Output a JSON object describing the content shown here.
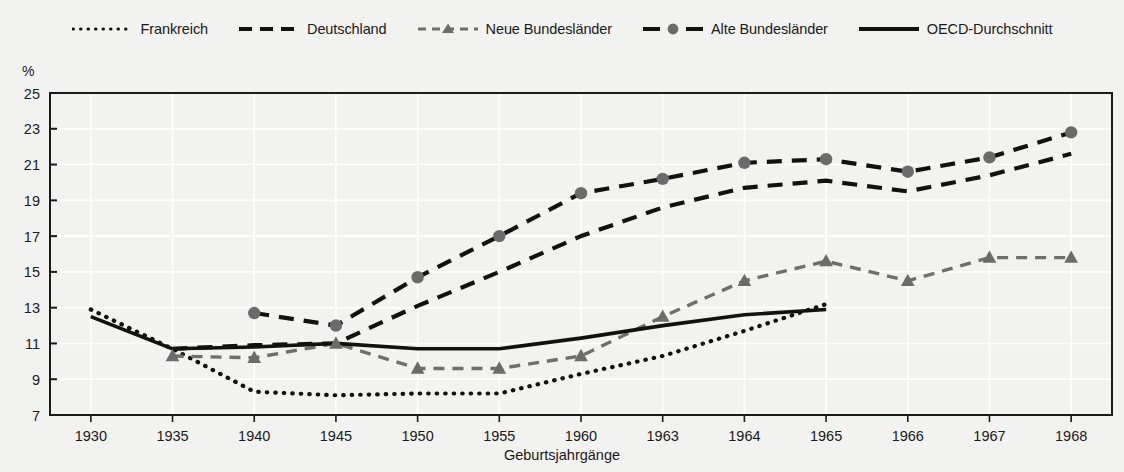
{
  "unit_label": "%",
  "xaxis_title": "Geburtsjahrgänge",
  "legend": [
    {
      "label": "Frankreich",
      "style": "dotted",
      "marker": "none",
      "icon": "dotted-line-icon"
    },
    {
      "label": "Deutschland",
      "style": "dashed-long",
      "marker": "none",
      "icon": "dashed-line-icon"
    },
    {
      "label": "Neue Bundesländer",
      "style": "dashed-gray",
      "marker": "triangle",
      "icon": "dashed-triangle-line-icon"
    },
    {
      "label": "Alte Bundesländer",
      "style": "dashed-long",
      "marker": "circle",
      "icon": "dashed-circle-line-icon"
    },
    {
      "label": "OECD-Durchschnitt",
      "style": "solid",
      "marker": "none",
      "icon": "solid-line-icon"
    }
  ],
  "colors": {
    "line_black": "#111111",
    "line_gray": "#6e6e6e",
    "marker_gray": "#6b6b6b",
    "plot_bg": "#f2f2f0",
    "gridline": "#ffffff",
    "axis": "#1a1a1a"
  },
  "chart_data": {
    "type": "line",
    "title": "",
    "subtitle": "",
    "xlabel": "Geburtsjahrgänge",
    "ylabel": "%",
    "ylim": [
      7,
      25
    ],
    "ytick_step": 2,
    "yticks": [
      7,
      9,
      11,
      13,
      15,
      17,
      19,
      21,
      23,
      25
    ],
    "grid": true,
    "legend_position": "top",
    "categories": [
      "1930",
      "1935",
      "1940",
      "1945",
      "1950",
      "1955",
      "1960",
      "1963",
      "1964",
      "1965",
      "1966",
      "1967",
      "1968"
    ],
    "series": [
      {
        "name": "Frankreich",
        "style": "dotted",
        "marker": "none",
        "color": "#111111",
        "values": [
          12.9,
          10.7,
          8.3,
          8.1,
          8.2,
          8.2,
          9.3,
          10.3,
          11.7,
          13.2,
          null,
          null,
          null
        ]
      },
      {
        "name": "Deutschland",
        "style": "dashed",
        "marker": "none",
        "color": "#111111",
        "values": [
          null,
          10.7,
          10.9,
          11.0,
          13.1,
          15.0,
          17.0,
          18.6,
          19.7,
          20.1,
          19.5,
          20.4,
          21.6
        ]
      },
      {
        "name": "Neue Bundesländer",
        "style": "dashed",
        "marker": "triangle",
        "color": "#6e6e6e",
        "values": [
          null,
          10.3,
          10.2,
          11.0,
          9.6,
          9.6,
          10.3,
          12.5,
          14.5,
          15.6,
          14.5,
          15.8,
          15.8
        ]
      },
      {
        "name": "Alte Bundesländer",
        "style": "dashed",
        "marker": "circle",
        "color": "#111111",
        "values": [
          null,
          null,
          12.7,
          12.0,
          14.7,
          17.0,
          19.4,
          20.2,
          21.1,
          21.3,
          20.6,
          21.4,
          22.8
        ]
      },
      {
        "name": "OECD-Durchschnitt",
        "style": "solid",
        "marker": "none",
        "color": "#111111",
        "values": [
          12.5,
          10.7,
          10.8,
          11.0,
          10.7,
          10.7,
          11.3,
          12.0,
          12.6,
          12.9,
          null,
          null,
          null
        ]
      }
    ]
  }
}
